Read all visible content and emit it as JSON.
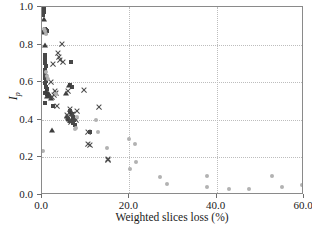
{
  "chart_data": {
    "type": "scatter",
    "title": "",
    "xlabel": "Weighted slices loss (%)",
    "ylabel": "I_p",
    "ylabel_base": "I",
    "ylabel_sub": "p",
    "xlim": [
      0.0,
      60.0
    ],
    "ylim": [
      0.0,
      1.0
    ],
    "xticks": [
      0.0,
      20.0,
      40.0,
      60.0
    ],
    "xtick_labels": [
      "0.0",
      "20.0",
      "40.0",
      "60.0"
    ],
    "yticks": [
      0.0,
      0.2,
      0.4,
      0.6,
      0.8,
      1.0
    ],
    "ytick_labels": [
      "0.0",
      "0.2",
      "0.4",
      "0.6",
      "0.8",
      "1.0"
    ],
    "grid": true,
    "grid_style": "dotted",
    "grid_color": "#bdbdbd",
    "legend": "none",
    "colors": {
      "square": "#474747",
      "triangle": "#3d3d3d",
      "cross": "#4a4a4a",
      "dot": "#b2b2b2",
      "frame": "#8a8a8a"
    },
    "series": [
      {
        "name": "squares",
        "marker": "square",
        "points": [
          [
            0.3,
            1.0
          ],
          [
            0.4,
            0.995
          ],
          [
            0.5,
            0.975
          ],
          [
            0.3,
            0.96
          ],
          [
            0.6,
            0.885
          ],
          [
            0.9,
            0.88
          ],
          [
            0.5,
            0.865
          ],
          [
            1.2,
            0.875
          ],
          [
            0.6,
            0.745
          ],
          [
            0.7,
            0.73
          ],
          [
            0.8,
            0.715
          ],
          [
            0.6,
            0.7
          ],
          [
            0.9,
            0.685
          ],
          [
            0.7,
            0.665
          ],
          [
            0.8,
            0.645
          ],
          [
            1.0,
            0.635
          ],
          [
            0.6,
            0.625
          ],
          [
            0.9,
            0.605
          ],
          [
            0.7,
            0.595
          ],
          [
            6.7,
            0.705
          ],
          [
            1.0,
            0.575
          ],
          [
            1.2,
            0.565
          ],
          [
            0.8,
            0.545
          ],
          [
            1.1,
            0.535
          ],
          [
            1.5,
            0.525
          ],
          [
            0.7,
            0.49
          ],
          [
            2.6,
            0.475
          ],
          [
            6.3,
            0.585
          ],
          [
            6.8,
            0.575
          ],
          [
            6.5,
            0.445
          ],
          [
            6.9,
            0.43
          ],
          [
            7.1,
            0.415
          ],
          [
            7.4,
            0.4
          ],
          [
            6.4,
            0.395
          ],
          [
            7.0,
            0.385
          ],
          [
            7.6,
            0.375
          ],
          [
            5.9,
            0.405
          ],
          [
            11.1,
            0.335
          ]
        ]
      },
      {
        "name": "triangles",
        "marker": "triangle",
        "points": [
          [
            0.4,
            0.935
          ],
          [
            0.6,
            0.865
          ],
          [
            0.8,
            0.8
          ],
          [
            0.9,
            0.555
          ],
          [
            1.3,
            0.545
          ],
          [
            1.6,
            0.535
          ],
          [
            1.1,
            0.525
          ],
          [
            2.0,
            0.515
          ],
          [
            2.3,
            0.345
          ],
          [
            6.2,
            0.585
          ],
          [
            5.6,
            0.545
          ],
          [
            6.6,
            0.44
          ],
          [
            5.8,
            0.42
          ],
          [
            6.1,
            0.405
          ]
        ]
      },
      {
        "name": "crosses",
        "marker": "cross",
        "points": [
          [
            4.6,
            0.805
          ],
          [
            3.7,
            0.755
          ],
          [
            4.0,
            0.735
          ],
          [
            4.2,
            0.72
          ],
          [
            2.5,
            0.695
          ],
          [
            4.9,
            0.705
          ],
          [
            2.1,
            0.6
          ],
          [
            2.9,
            0.555
          ],
          [
            3.2,
            0.54
          ],
          [
            2.7,
            0.53
          ],
          [
            2.4,
            0.52
          ],
          [
            3.5,
            0.475
          ],
          [
            5.9,
            0.555
          ],
          [
            6.4,
            0.455
          ],
          [
            9.6,
            0.558
          ],
          [
            13.1,
            0.47
          ],
          [
            5.7,
            0.425
          ],
          [
            6.0,
            0.415
          ],
          [
            6.3,
            0.4
          ],
          [
            6.6,
            0.39
          ],
          [
            7.2,
            0.43
          ],
          [
            7.8,
            0.4
          ],
          [
            8.0,
            0.445
          ],
          [
            10.5,
            0.335
          ],
          [
            10.6,
            0.27
          ],
          [
            10.9,
            0.265
          ],
          [
            15.0,
            0.19
          ],
          [
            15.2,
            0.185
          ]
        ]
      },
      {
        "name": "dots",
        "marker": "dot",
        "points": [
          [
            0.4,
            0.885
          ],
          [
            0.8,
            0.875
          ],
          [
            1.0,
            0.855
          ],
          [
            0.9,
            0.655
          ],
          [
            1.1,
            0.635
          ],
          [
            1.3,
            0.615
          ],
          [
            3.1,
            0.535
          ],
          [
            8.1,
            0.415
          ],
          [
            7.9,
            0.355
          ],
          [
            7.5,
            0.352
          ],
          [
            12.9,
            0.335
          ],
          [
            12.4,
            0.4
          ],
          [
            14.8,
            0.25
          ],
          [
            0.2,
            0.235
          ],
          [
            20.0,
            0.3
          ],
          [
            21.3,
            0.27
          ],
          [
            21.5,
            0.175
          ],
          [
            20.2,
            0.14
          ],
          [
            27.1,
            0.095
          ],
          [
            28.6,
            0.06
          ],
          [
            37.7,
            0.1
          ],
          [
            37.9,
            0.04
          ],
          [
            42.8,
            0.03
          ],
          [
            47.3,
            0.03
          ],
          [
            52.6,
            0.1
          ],
          [
            55.0,
            0.045
          ],
          [
            59.6,
            0.055
          ]
        ]
      }
    ]
  }
}
